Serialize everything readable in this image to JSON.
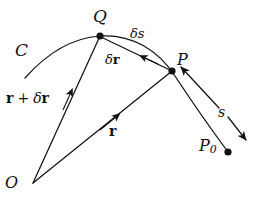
{
  "figure": {
    "background_color": "#ffffff",
    "ink_color": "#111111",
    "width": 257,
    "height": 201
  },
  "labels": {
    "curve": "C",
    "point_Q": "Q",
    "point_P": "P",
    "point_P0_base": "P",
    "point_P0_sub": "0",
    "origin": "O",
    "delta_s": "δs",
    "delta_r_delta": "δ",
    "delta_r_vec": "r",
    "r_plus_delta_r_r1": "r",
    "r_plus_delta_r_plus": "+",
    "r_plus_delta_r_delta": "δ",
    "r_plus_delta_r_r2": "r",
    "r_vector": "r",
    "arc_length": "s"
  },
  "points": {
    "Q": {
      "x": 100,
      "y": 36,
      "label": "Q",
      "dot": true
    },
    "P": {
      "x": 172,
      "y": 71,
      "label": "P",
      "dot": true
    },
    "P0": {
      "x": 228,
      "y": 152,
      "label": "P0",
      "dot": true
    },
    "O": {
      "x": 33,
      "y": 183,
      "label": "O",
      "dot": false
    }
  },
  "geometry": {
    "curve_C_path": "M 25,78 C 48,52 72,38 100,36 C 132,34 158,50 175,76 C 194,105 214,133 228,152",
    "vector_O_to_Q": {
      "from": [
        33,
        183
      ],
      "to": [
        100,
        36
      ],
      "arrow_at": [
        70,
        95
      ]
    },
    "vector_O_to_P": {
      "from": [
        33,
        183
      ],
      "to": [
        172,
        71
      ],
      "arrow_at": [
        113,
        120
      ]
    },
    "segment_P_to_Q": {
      "from": [
        172,
        71
      ],
      "to": [
        100,
        36
      ],
      "arrow_at": [
        143,
        58
      ]
    },
    "pointer_to_P": {
      "from": [
        218,
        107
      ],
      "to": [
        180,
        67
      ]
    },
    "direction_arrow_s": {
      "from": [
        228,
        118
      ],
      "to": [
        247,
        141
      ]
    }
  }
}
